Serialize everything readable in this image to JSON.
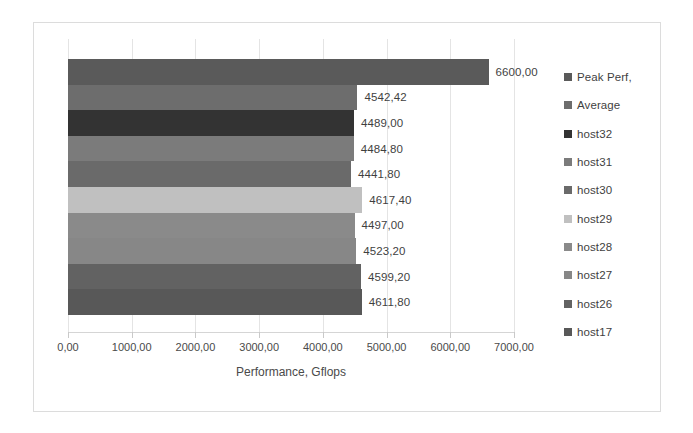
{
  "chart_data": {
    "type": "bar",
    "orientation": "horizontal",
    "title": "",
    "xlabel": "Performance, Gflops",
    "ylabel": "",
    "xlim": [
      0,
      7000
    ],
    "xticks": [
      "0,00",
      "1000,00",
      "2000,00",
      "3000,00",
      "4000,00",
      "5000,00",
      "6000,00",
      "7000,00"
    ],
    "xtick_values": [
      0,
      1000,
      2000,
      3000,
      4000,
      5000,
      6000,
      7000
    ],
    "grid": true,
    "legend_position": "right",
    "categories": [
      "Peak Perf,",
      "Average",
      "host32",
      "host31",
      "host30",
      "host29",
      "host28",
      "host27",
      "host26",
      "host17"
    ],
    "values": [
      6600.0,
      4542.42,
      4489.0,
      4484.8,
      4441.8,
      4617.4,
      4497.0,
      4523.2,
      4599.2,
      4611.8
    ],
    "value_labels": [
      "6600,00",
      "4542,42",
      "4489,00",
      "4484,80",
      "4441,80",
      "4617,40",
      "4497,00",
      "4523,20",
      "4599,20",
      "4611,80"
    ],
    "colors": [
      "#5a5a5a",
      "#6d6d6d",
      "#333333",
      "#7b7b7b",
      "#6a6a6a",
      "#c0c0c0",
      "#8a8a8a",
      "#878787",
      "#626262",
      "#585858"
    ],
    "series": [
      {
        "name": "Peak Perf,",
        "value": 6600.0,
        "value_label": "6600,00",
        "color": "#5a5a5a"
      },
      {
        "name": "Average",
        "value": 4542.42,
        "value_label": "4542,42",
        "color": "#6d6d6d"
      },
      {
        "name": "host32",
        "value": 4489.0,
        "value_label": "4489,00",
        "color": "#333333"
      },
      {
        "name": "host31",
        "value": 4484.8,
        "value_label": "4484,80",
        "color": "#7b7b7b"
      },
      {
        "name": "host30",
        "value": 4441.8,
        "value_label": "4441,80",
        "color": "#6a6a6a"
      },
      {
        "name": "host29",
        "value": 4617.4,
        "value_label": "4617,40",
        "color": "#c0c0c0"
      },
      {
        "name": "host28",
        "value": 4497.0,
        "value_label": "4497,00",
        "color": "#8a8a8a"
      },
      {
        "name": "host27",
        "value": 4523.2,
        "value_label": "4523,20",
        "color": "#878787"
      },
      {
        "name": "host26",
        "value": 4599.2,
        "value_label": "4599,20",
        "color": "#626262"
      },
      {
        "name": "host17",
        "value": 4611.8,
        "value_label": "4611,80",
        "color": "#585858"
      }
    ]
  },
  "chart": {
    "axis_title": "Performance, Gflops",
    "border_color": "#dcdcdc",
    "gridline_color": "#e4e4e4",
    "text_color": "#3f3f3f"
  }
}
